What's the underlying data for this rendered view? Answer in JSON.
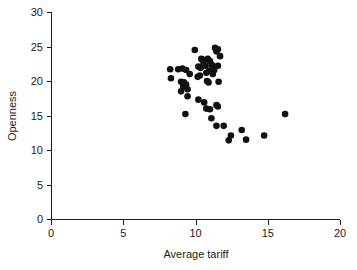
{
  "chart_data": {
    "type": "scatter",
    "title": "",
    "xlabel": "Average tariff",
    "ylabel": "Openness",
    "xlim": [
      0,
      20
    ],
    "ylim": [
      0,
      30
    ],
    "xticks": [
      0,
      5,
      10,
      15,
      20
    ],
    "yticks": [
      0,
      5,
      10,
      15,
      20,
      25,
      30
    ],
    "grid": false,
    "legend": null,
    "marker": "filled-circle",
    "marker_color": "#111111",
    "points": [
      {
        "x": 8.25,
        "y": 21.7
      },
      {
        "x": 8.3,
        "y": 20.4
      },
      {
        "x": 8.8,
        "y": 21.7
      },
      {
        "x": 9.1,
        "y": 21.8
      },
      {
        "x": 9.35,
        "y": 21.6
      },
      {
        "x": 9.0,
        "y": 19.9
      },
      {
        "x": 9.2,
        "y": 19.8
      },
      {
        "x": 9.35,
        "y": 19.5
      },
      {
        "x": 9.15,
        "y": 19.2
      },
      {
        "x": 9.0,
        "y": 18.5
      },
      {
        "x": 9.45,
        "y": 18.8
      },
      {
        "x": 9.6,
        "y": 21.0
      },
      {
        "x": 9.45,
        "y": 17.8
      },
      {
        "x": 9.3,
        "y": 15.2
      },
      {
        "x": 9.95,
        "y": 24.5
      },
      {
        "x": 10.4,
        "y": 23.2
      },
      {
        "x": 10.5,
        "y": 23.1
      },
      {
        "x": 10.55,
        "y": 22.6
      },
      {
        "x": 10.2,
        "y": 22.1
      },
      {
        "x": 10.35,
        "y": 21.9
      },
      {
        "x": 10.7,
        "y": 22.2
      },
      {
        "x": 10.85,
        "y": 23.2
      },
      {
        "x": 11.0,
        "y": 22.9
      },
      {
        "x": 11.15,
        "y": 22.3
      },
      {
        "x": 10.95,
        "y": 21.5
      },
      {
        "x": 10.75,
        "y": 21.2
      },
      {
        "x": 10.3,
        "y": 20.8
      },
      {
        "x": 10.15,
        "y": 20.6
      },
      {
        "x": 10.8,
        "y": 20.0
      },
      {
        "x": 10.9,
        "y": 19.8
      },
      {
        "x": 11.2,
        "y": 21.0
      },
      {
        "x": 11.3,
        "y": 21.6
      },
      {
        "x": 11.35,
        "y": 24.8
      },
      {
        "x": 11.45,
        "y": 24.3
      },
      {
        "x": 11.55,
        "y": 24.6
      },
      {
        "x": 11.7,
        "y": 23.6
      },
      {
        "x": 11.55,
        "y": 22.2
      },
      {
        "x": 11.6,
        "y": 19.9
      },
      {
        "x": 10.2,
        "y": 17.3
      },
      {
        "x": 10.6,
        "y": 16.9
      },
      {
        "x": 10.75,
        "y": 16.0
      },
      {
        "x": 11.0,
        "y": 15.9
      },
      {
        "x": 11.1,
        "y": 14.6
      },
      {
        "x": 11.45,
        "y": 16.5
      },
      {
        "x": 11.55,
        "y": 16.3
      },
      {
        "x": 11.45,
        "y": 13.5
      },
      {
        "x": 11.95,
        "y": 13.5
      },
      {
        "x": 12.3,
        "y": 11.4
      },
      {
        "x": 12.45,
        "y": 12.1
      },
      {
        "x": 13.2,
        "y": 12.9
      },
      {
        "x": 13.5,
        "y": 11.5
      },
      {
        "x": 14.75,
        "y": 12.1
      },
      {
        "x": 16.2,
        "y": 15.2
      }
    ]
  },
  "axes": {
    "x_tick_labels": [
      "0",
      "5",
      "10",
      "15",
      "20"
    ],
    "y_tick_labels": [
      "0",
      "5",
      "10",
      "15",
      "20",
      "25",
      "30"
    ],
    "x_axis_title": "Average tariff",
    "y_axis_title": "Openness"
  }
}
